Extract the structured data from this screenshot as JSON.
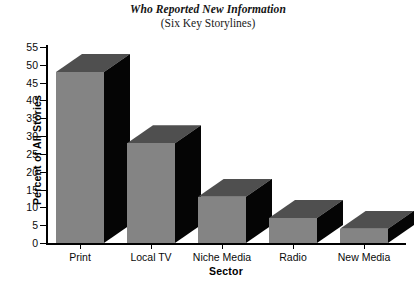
{
  "chart_data": {
    "type": "bar",
    "title": "Who Reported New Information",
    "subtitle": "(Six Key Storylines)",
    "xlabel": "Sector",
    "ylabel": "Percent of All Stories",
    "categories": [
      "Print",
      "Local TV",
      "Niche Media",
      "Radio",
      "New Media"
    ],
    "values": [
      48,
      28,
      13,
      7,
      4
    ],
    "ylim": [
      0,
      55
    ],
    "ytick_values": [
      0,
      5,
      10,
      15,
      20,
      25,
      30,
      35,
      40,
      45,
      50,
      55
    ],
    "ytick_labels": [
      "0",
      "5",
      "10",
      "15",
      "20",
      "25",
      "30",
      "35",
      "40",
      "45",
      "50",
      "55"
    ],
    "grid": false,
    "legend": null,
    "style": "3d-bar",
    "colors": {
      "bar_front": "#848484",
      "bar_top": "#4f4f4f",
      "bar_side": "#050505",
      "axis": "#000000",
      "background": "#ffffff"
    }
  }
}
